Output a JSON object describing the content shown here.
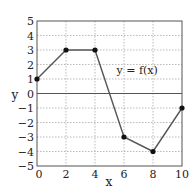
{
  "chart_data": {
    "type": "line",
    "title": "",
    "xlabel": "x",
    "ylabel": "y",
    "xlim": [
      0,
      10
    ],
    "ylim": [
      -5,
      5
    ],
    "grid": true,
    "x_ticks": [
      0,
      2,
      4,
      6,
      8,
      10
    ],
    "y_ticks": [
      5,
      4,
      3,
      2,
      1,
      0,
      -1,
      -2,
      -3,
      -4,
      -5
    ],
    "series": [
      {
        "name": "y = f(x)",
        "x": [
          0,
          2,
          4,
          6,
          8,
          10
        ],
        "values": [
          1,
          3,
          3,
          -3,
          -4,
          -1
        ],
        "color": "#555555",
        "marker": "circle"
      }
    ],
    "annotations": [
      {
        "text": "y = f(x)",
        "x": 5.0,
        "y": 1.6
      }
    ]
  },
  "labels": {
    "x_axis": "x",
    "y_axis": "y",
    "series_label": "y = f(x)",
    "x_tick_labels": [
      "0",
      "2",
      "4",
      "6",
      "8",
      "10"
    ],
    "y_tick_labels": [
      "5",
      "4",
      "3",
      "2",
      "1",
      "0",
      "−1",
      "−2",
      "−3",
      "−4",
      "−5"
    ]
  },
  "colors": {
    "line": "#555555",
    "marker": "#111111",
    "grid": "#aaaaaa",
    "frame": "#555555",
    "zero_line": "#555555"
  }
}
